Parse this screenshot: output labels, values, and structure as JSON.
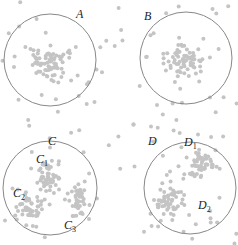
{
  "diagram": {
    "title": "",
    "colors": {
      "point": "#c4c4c4",
      "circle": "#888888",
      "label": "#222222",
      "background": "#ffffff"
    },
    "regions": [
      {
        "id": "A",
        "label": "A",
        "cx": 50,
        "cy": 60,
        "r": 46,
        "label_x": 76,
        "label_y": 18,
        "pattern": "single dense cluster",
        "sub": []
      },
      {
        "id": "B",
        "label": "B",
        "cx": 186,
        "cy": 58,
        "r": 46,
        "label_x": 144,
        "label_y": 20,
        "pattern": "single dense cluster",
        "sub": []
      },
      {
        "id": "C",
        "label": "C",
        "cx": 50,
        "cy": 188,
        "r": 47,
        "label_x": 48,
        "label_y": 145,
        "pattern": "three sub-clusters",
        "sub": [
          {
            "label": "C",
            "index": "1",
            "x": 36,
            "y": 163
          },
          {
            "label": "C",
            "index": "2",
            "x": 13,
            "y": 197
          },
          {
            "label": "C",
            "index": "3",
            "x": 64,
            "y": 229
          }
        ]
      },
      {
        "id": "D",
        "label": "D",
        "cx": 190,
        "cy": 188,
        "r": 46,
        "label_x": 148,
        "label_y": 145,
        "pattern": "two sub-clusters",
        "sub": [
          {
            "label": "D",
            "index": "1",
            "x": 184,
            "y": 146
          },
          {
            "label": "D",
            "index": "2",
            "x": 198,
            "y": 209
          }
        ]
      }
    ]
  }
}
